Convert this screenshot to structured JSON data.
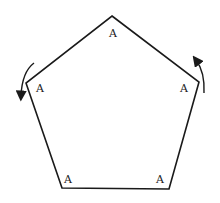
{
  "diagram": {
    "shape": "regular pentagon",
    "vertices": [
      {
        "id": "top",
        "label": "A"
      },
      {
        "id": "right",
        "label": "A"
      },
      {
        "id": "bottom-right",
        "label": "A"
      },
      {
        "id": "bottom-left",
        "label": "A"
      },
      {
        "id": "left",
        "label": "A"
      }
    ],
    "arrows": [
      {
        "position": "left vertex",
        "direction": "counterclockwise-down"
      },
      {
        "position": "right vertex",
        "direction": "upward"
      }
    ],
    "colors": {
      "stroke": "#1a1a1a",
      "background": "#ffffff"
    }
  }
}
